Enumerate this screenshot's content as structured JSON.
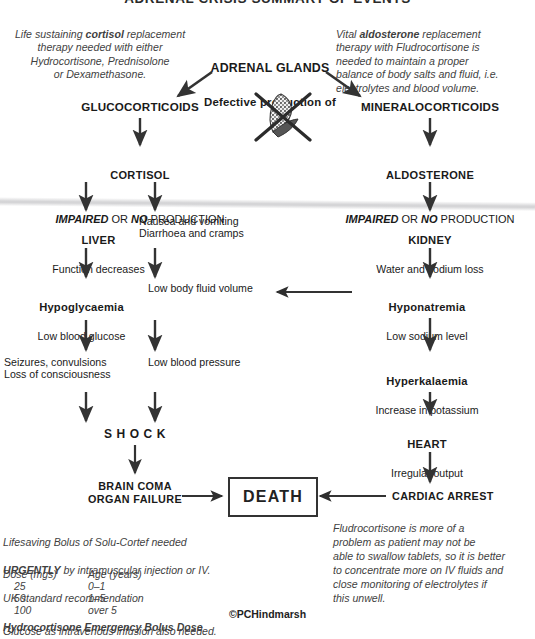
{
  "title": "ADRENAL CRISIS SUMMARY OF EVENTS",
  "notes": {
    "cortisol_note_line1": "Life sustaining ",
    "cortisol_note_bold": "cortisol",
    "cortisol_note_rest": " replacement\ntherapy needed with either\nHydrocortisone, Prednisolone\nor Dexamethasone.",
    "aldosterone_note_line1": "Vital ",
    "aldosterone_note_bold": "aldosterone",
    "aldosterone_note_rest": " replacement\ntherapy with Fludrocortisone is\nneeded to maintain a proper\nbalance of body salts and fluid, i.e.\nelectrolytes and blood volume."
  },
  "flow": {
    "adrenal_glands": "ADRENAL GLANDS",
    "adrenal_sub": "Defective production of",
    "glucocorticoids": "GLUCOCORTICOIDS",
    "mineralocorticoids": "MINERALOCORTICOIDS",
    "cortisol": "CORTISOL",
    "cortisol_impaired_a": "IMPAIRED",
    "cortisol_impaired_b": " OR ",
    "cortisol_impaired_c": "NO",
    "cortisol_impaired_d": " PRODUCTION",
    "aldosterone": "ALDOSTERONE",
    "liver": "LIVER",
    "liver_sub": "Function decreases",
    "gi": "Nausea and vomiting\nDiarrhoea and cramps",
    "kidney": "KIDNEY",
    "kidney_sub": "Water and sodium loss",
    "hypoglycaemia": "Hypoglycaemia",
    "hypoglycaemia_sub": "Low blood glucose",
    "low_fluid": "Low body fluid volume",
    "hyponatremia": "Hyponatremia",
    "hyponatremia_sub": "Low sodium level",
    "seizures": "Seizures, convulsions\nLoss of consciousness",
    "low_bp": "Low blood pressure",
    "hyperkalaemia": "Hyperkalaemia",
    "hyperkalaemia_sub": "Increase in potassium",
    "shock": "S H O C K",
    "heart": "HEART",
    "heart_sub": "Irregular output",
    "brain_coma": "BRAIN COMA\nORGAN FAILURE",
    "death": "DEATH",
    "cardiac_arrest": "CARDIAC ARREST"
  },
  "treatment": {
    "line1": "Lifesaving Bolus of Solu-Cortef needed",
    "urgent_bold": "URGENTLY",
    "line2_rest": " by intramuscular injection or IV.",
    "line3": "UK standard recommendation",
    "table_title": "Hydrocortisone Emergency Bolus Dose",
    "col1": "Dose (mgs)",
    "col2": "Age (years)",
    "rows": [
      {
        "dose": "25",
        "age": "0–1"
      },
      {
        "dose": "50",
        "age": "1–5"
      },
      {
        "dose": "100",
        "age": "over 5"
      }
    ],
    "footer": "Glucose as intravenous infusion also needed."
  },
  "fludro_note": "Fludrocortisone is more of a\nproblem as patient may not be\nable to swallow tablets, so it is better\nto concentrate more on IV fluids and\nclose monitoring of electrolytes  if\nthis unwell.",
  "copyright": "©PCHindmarsh",
  "icons": {
    "crossed_gland": "crossed-out-adrenal-gland"
  },
  "colors": {
    "ink": "#1a1a1a",
    "note": "#3f3f3f",
    "arrow": "#333333"
  }
}
